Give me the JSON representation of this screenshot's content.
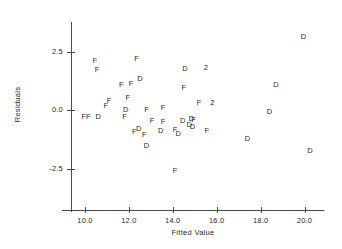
{
  "chart_data": {
    "type": "scatter",
    "title": "",
    "xlabel": "Fitted Value",
    "ylabel": "Residuals",
    "xlim": [
      8.9,
      21.2
    ],
    "ylim": [
      -4.2,
      3.7
    ],
    "grid": false,
    "legend": "none",
    "xticks": [
      10.0,
      12.0,
      14.0,
      16.0,
      18.0,
      20.0
    ],
    "xticklabels": [
      "10.0",
      "12.0",
      "14.0",
      "16.0",
      "18.0",
      "20.0"
    ],
    "yticks": [
      2.5,
      0.0,
      -2.5
    ],
    "yticklabels": [
      "2.5",
      "0.0",
      "-2.5"
    ],
    "marker_note": "Each point plotted as a letter code; '2' denotes two overlapping points",
    "points": [
      {
        "label": "F",
        "x": 10.45,
        "y": 2.08
      },
      {
        "label": "F",
        "x": 10.55,
        "y": 1.72
      },
      {
        "label": "F",
        "x": 12.35,
        "y": 2.18
      },
      {
        "label": "D",
        "x": 14.55,
        "y": 1.75
      },
      {
        "label": "2",
        "x": 15.5,
        "y": 1.78
      },
      {
        "label": "D",
        "x": 19.95,
        "y": 3.12
      },
      {
        "label": "D",
        "x": 12.5,
        "y": 1.32
      },
      {
        "label": "F",
        "x": 11.65,
        "y": 1.08
      },
      {
        "label": "F",
        "x": 12.1,
        "y": 1.12
      },
      {
        "label": "F",
        "x": 14.5,
        "y": 0.95
      },
      {
        "label": "D",
        "x": 18.7,
        "y": 1.05
      },
      {
        "label": "F",
        "x": 11.1,
        "y": 0.38
      },
      {
        "label": "F",
        "x": 11.95,
        "y": 0.52
      },
      {
        "label": "F",
        "x": 10.95,
        "y": 0.18
      },
      {
        "label": "F",
        "x": 15.2,
        "y": 0.3
      },
      {
        "label": "2",
        "x": 15.8,
        "y": 0.32
      },
      {
        "label": "D",
        "x": 11.85,
        "y": 0.02
      },
      {
        "label": "F",
        "x": 12.8,
        "y": 0.0
      },
      {
        "label": "F",
        "x": 13.55,
        "y": 0.1
      },
      {
        "label": "D",
        "x": 18.4,
        "y": -0.1
      },
      {
        "label": "F",
        "x": 9.95,
        "y": -0.28
      },
      {
        "label": "F",
        "x": 10.15,
        "y": -0.28
      },
      {
        "label": "D",
        "x": 10.6,
        "y": -0.3
      },
      {
        "label": "F",
        "x": 11.8,
        "y": -0.32
      },
      {
        "label": "F",
        "x": 13.05,
        "y": -0.45
      },
      {
        "label": "F",
        "x": 13.55,
        "y": -0.52
      },
      {
        "label": "D",
        "x": 14.45,
        "y": -0.45
      },
      {
        "label": "D",
        "x": 14.85,
        "y": -0.4
      },
      {
        "label": "F",
        "x": 14.95,
        "y": -0.42
      },
      {
        "label": "D",
        "x": 14.75,
        "y": -0.62
      },
      {
        "label": "D",
        "x": 14.9,
        "y": -0.72
      },
      {
        "label": "F",
        "x": 12.25,
        "y": -0.92
      },
      {
        "label": "D",
        "x": 12.45,
        "y": -0.82
      },
      {
        "label": "D",
        "x": 13.45,
        "y": -0.88
      },
      {
        "label": "F",
        "x": 14.1,
        "y": -0.85
      },
      {
        "label": "D",
        "x": 14.25,
        "y": -1.02
      },
      {
        "label": "F",
        "x": 15.55,
        "y": -0.88
      },
      {
        "label": "D",
        "x": 17.4,
        "y": -1.22
      },
      {
        "label": "F",
        "x": 12.7,
        "y": -1.05
      },
      {
        "label": "D",
        "x": 12.8,
        "y": -1.52
      },
      {
        "label": "D",
        "x": 20.25,
        "y": -1.75
      },
      {
        "label": "F",
        "x": 14.1,
        "y": -2.62
      }
    ]
  },
  "axes": {
    "x_title": "Fitted Value",
    "y_title": "Residuals"
  }
}
